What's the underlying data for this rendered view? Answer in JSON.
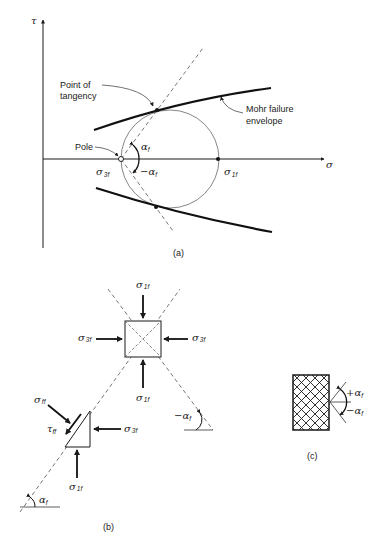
{
  "figure": {
    "panels": [
      {
        "id": "a",
        "caption": "(a)",
        "axes": {
          "x_label": "σ",
          "y_label": "τ"
        },
        "annotations": {
          "tangency_line1": "Point of",
          "tangency_line2": "tangency",
          "envelope_line1": "Mohr failure",
          "envelope_line2": "envelope",
          "pole": "Pole",
          "sigma3f": "σ",
          "sigma3f_sub": "3f",
          "sigma1f": "σ",
          "sigma1f_sub": "1f",
          "alpha_pos": "α",
          "alpha_pos_sub": "f",
          "alpha_neg": "−α",
          "alpha_neg_sub": "f"
        }
      },
      {
        "id": "b",
        "caption": "(b)",
        "labels": {
          "sigma1f_top": "σ",
          "sigma1f_top_sub": "1f",
          "sigma3f_left": "σ",
          "sigma3f_left_sub": "3f",
          "sigma3f_right": "σ",
          "sigma3f_right_sub": "3f",
          "sigma1f_bottom": "σ",
          "sigma1f_bottom_sub": "1f",
          "sigma_ff": "σ",
          "sigma_ff_sub": "ff",
          "tau_ff": "τ",
          "tau_ff_sub": "ff",
          "sigma3f_tri": "σ",
          "sigma3f_tri_sub": "3f",
          "sigma1f_tri": "σ",
          "sigma1f_tri_sub": "1f",
          "alpha_neg": "−α",
          "alpha_neg_sub": "f",
          "alpha_pos": "α",
          "alpha_pos_sub": "f"
        }
      },
      {
        "id": "c",
        "caption": "(c)",
        "labels": {
          "alpha_pos": "+α",
          "alpha_pos_sub": "f",
          "alpha_neg": "−α",
          "alpha_neg_sub": "f"
        }
      }
    ],
    "colors": {
      "ink": "#1a1a1a",
      "thin": "#555555",
      "background": "#ffffff"
    }
  }
}
